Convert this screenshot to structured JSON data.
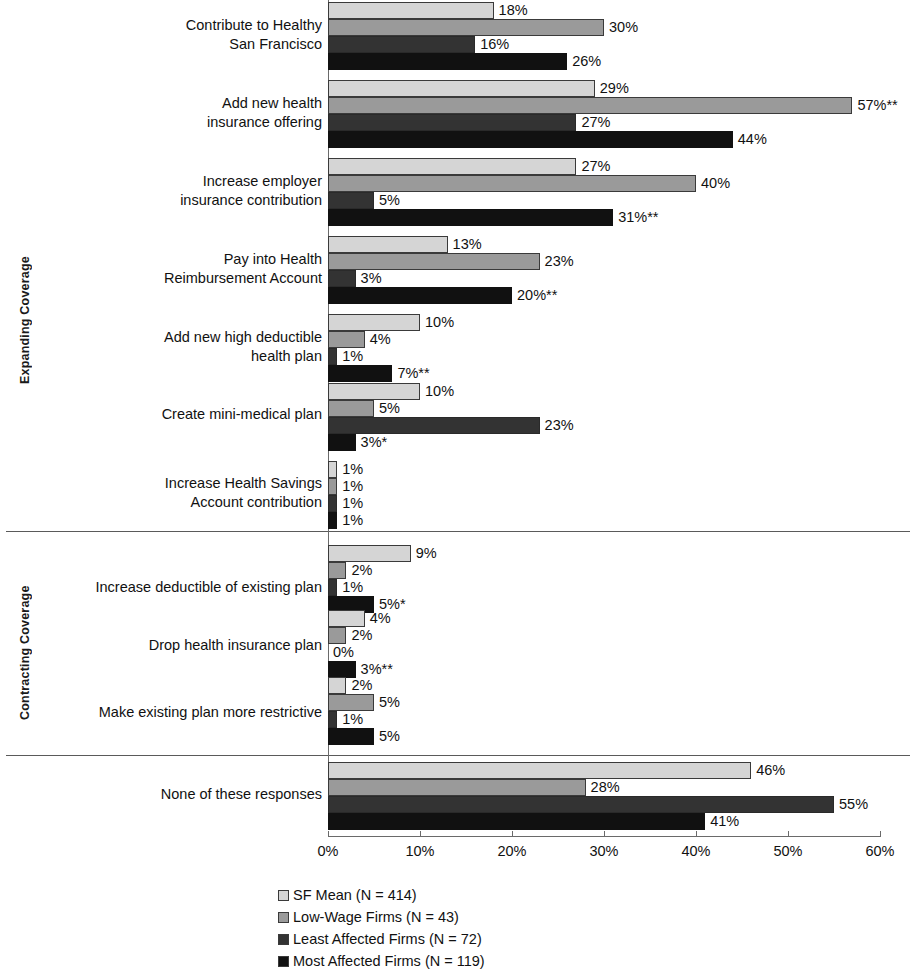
{
  "chart_data": {
    "type": "bar",
    "orientation": "horizontal",
    "title": "",
    "xlabel": "",
    "ylabel": "",
    "xlim": [
      0,
      60
    ],
    "xticks": [
      "0%",
      "10%",
      "20%",
      "30%",
      "40%",
      "50%",
      "60%"
    ],
    "xtick_values": [
      0,
      10,
      20,
      30,
      40,
      50,
      60
    ],
    "grid": false,
    "legend_position": "bottom",
    "series": [
      {
        "name": "SF Mean (N = 414)",
        "color": "#d5d5d5",
        "values": [
          18,
          29,
          27,
          13,
          10,
          10,
          1,
          9,
          4,
          2,
          46
        ]
      },
      {
        "name": "Low-Wage Firms (N = 43)",
        "color": "#9a9a9a",
        "values": [
          30,
          57,
          40,
          23,
          4,
          5,
          1,
          2,
          2,
          5,
          28
        ]
      },
      {
        "name": "Least Affected Firms (N = 72)",
        "color": "#333333",
        "values": [
          16,
          27,
          5,
          3,
          1,
          23,
          1,
          1,
          0,
          1,
          55
        ]
      },
      {
        "name": "Most Affected Firms (N = 119)",
        "color": "#111111",
        "values": [
          26,
          44,
          31,
          20,
          7,
          3,
          1,
          5,
          3,
          5,
          41
        ]
      }
    ],
    "categories": [
      "Contribute to Healthy\nSan Francisco",
      "Add new health\ninsurance offering",
      "Increase employer\ninsurance contribution",
      "Pay into Health\nReimbursement Account",
      "Add new high deductible\nhealth plan",
      "Create mini-medical plan",
      "Increase Health Savings\nAccount contribution",
      "Increase deductible of existing plan",
      "Drop health insurance plan",
      "Make existing plan more restrictive",
      "None of these responses"
    ],
    "data_labels": [
      [
        "18%",
        "30%",
        "16%",
        "26%"
      ],
      [
        "29%",
        "57%**",
        "27%",
        "44%"
      ],
      [
        "27%",
        "40%",
        "5%",
        "31%**"
      ],
      [
        "13%",
        "23%",
        "3%",
        "20%**"
      ],
      [
        "10%",
        "4%",
        "1%",
        "7%**"
      ],
      [
        "10%",
        "5%",
        "23%",
        "3%*"
      ],
      [
        "1%",
        "1%",
        "1%",
        "1%"
      ],
      [
        "9%",
        "2%",
        "1%",
        "5%*"
      ],
      [
        "4%",
        "2%",
        "0%",
        "3%**"
      ],
      [
        "2%",
        "5%",
        "1%",
        "5%"
      ],
      [
        "46%",
        "28%",
        "55%",
        "41%"
      ]
    ],
    "groups": [
      {
        "label": "Expanding Coverage",
        "categories": 7
      },
      {
        "label": "Contracting Coverage",
        "categories": 3
      },
      {
        "label": "",
        "categories": 1
      }
    ]
  },
  "legend": {
    "items": [
      {
        "label": "SF Mean (N = 414)",
        "color": "#d5d5d5"
      },
      {
        "label": "Low-Wage Firms (N = 43)",
        "color": "#9a9a9a"
      },
      {
        "label": "Least Affected Firms (N = 72)",
        "color": "#333333"
      },
      {
        "label": "Most Affected Firms (N = 119)",
        "color": "#111111"
      }
    ]
  },
  "axis": {
    "group_labels": [
      "Expanding Coverage",
      "Contracting Coverage"
    ]
  }
}
